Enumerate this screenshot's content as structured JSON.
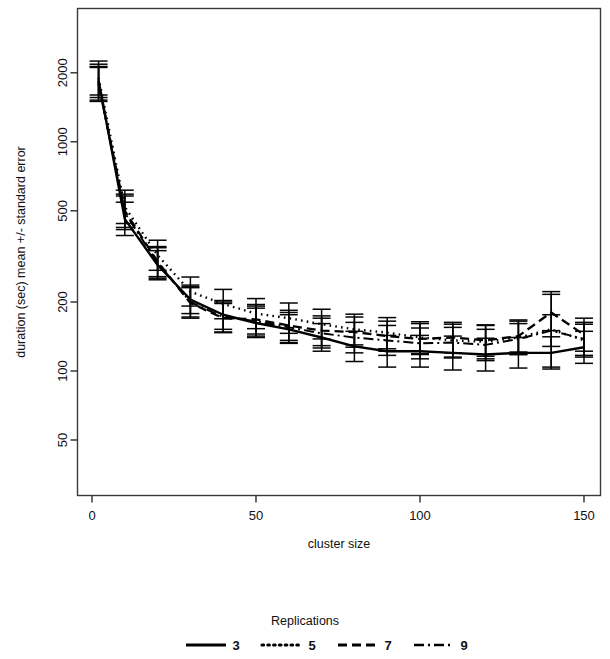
{
  "chart_data": {
    "type": "line",
    "title": "",
    "xlabel": "cluster size",
    "ylabel": "duration (sec) mean +/- standard error",
    "yscale": "log",
    "xscale": "linear",
    "xlim": [
      -7,
      158
    ],
    "ylim": [
      38,
      3100
    ],
    "grid": false,
    "x_ticks": [
      0,
      50,
      100,
      150
    ],
    "x_tick_labels": [
      "0",
      "50",
      "100",
      "150"
    ],
    "y_ticks": [
      50,
      100,
      200,
      500,
      1000,
      2000
    ],
    "y_tick_labels": [
      "50",
      "100",
      "200",
      "500",
      "1000",
      "2000"
    ],
    "legend": {
      "title": "Replications",
      "position": "bottom",
      "entries": [
        {
          "label": "3",
          "style": "solid"
        },
        {
          "label": "5",
          "style": "dotted"
        },
        {
          "label": "7",
          "style": "dashed"
        },
        {
          "label": "9",
          "style": "dashdot"
        }
      ]
    },
    "x": [
      2,
      10,
      20,
      30,
      40,
      50,
      60,
      70,
      80,
      90,
      100,
      110,
      120,
      130,
      140,
      150
    ],
    "series": [
      {
        "name": "3",
        "style": "solid",
        "values": [
          1850,
          460,
          290,
          205,
          176,
          162,
          152,
          140,
          128,
          122,
          122,
          120,
          118,
          120,
          120,
          127
        ],
        "err_low": [
          1560,
          390,
          250,
          178,
          152,
          140,
          132,
          122,
          110,
          104,
          104,
          101,
          100,
          103,
          102,
          108
        ],
        "err_high": [
          2180,
          545,
          335,
          237,
          203,
          188,
          176,
          161,
          149,
          143,
          143,
          142,
          139,
          140,
          141,
          149
        ]
      },
      {
        "name": "5",
        "style": "dotted",
        "values": [
          1900,
          520,
          320,
          222,
          196,
          178,
          170,
          160,
          152,
          147,
          140,
          136,
          134,
          140,
          152,
          136
        ],
        "err_low": [
          1600,
          440,
          275,
          192,
          169,
          153,
          146,
          138,
          130,
          125,
          119,
          115,
          113,
          118,
          104,
          115
        ],
        "err_high": [
          2250,
          615,
          372,
          257,
          227,
          207,
          198,
          186,
          177,
          171,
          164,
          160,
          158,
          165,
          222,
          160
        ]
      },
      {
        "name": "7",
        "style": "dashed",
        "values": [
          1800,
          500,
          300,
          198,
          170,
          168,
          158,
          150,
          148,
          142,
          138,
          140,
          136,
          142,
          180,
          144
        ],
        "err_low": [
          1520,
          423,
          258,
          170,
          147,
          145,
          136,
          129,
          127,
          122,
          118,
          120,
          116,
          121,
          150,
          122
        ],
        "err_high": [
          2130,
          591,
          349,
          231,
          197,
          195,
          184,
          174,
          172,
          165,
          161,
          163,
          159,
          167,
          216,
          170
        ]
      },
      {
        "name": "9",
        "style": "dashdot",
        "values": [
          1780,
          490,
          296,
          200,
          172,
          165,
          155,
          146,
          140,
          136,
          132,
          133,
          130,
          138,
          150,
          138
        ],
        "err_low": [
          1500,
          414,
          254,
          172,
          148,
          142,
          133,
          126,
          120,
          117,
          113,
          114,
          111,
          118,
          128,
          117
        ],
        "err_high": [
          2110,
          580,
          345,
          233,
          200,
          192,
          180,
          170,
          163,
          158,
          154,
          155,
          152,
          161,
          176,
          163
        ]
      }
    ]
  },
  "figure": {
    "background_color": "#ffffff",
    "line_color": "#000000",
    "axis_color": "#3a3a3a"
  }
}
